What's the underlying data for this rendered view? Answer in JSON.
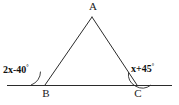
{
  "figure": {
    "type": "triangle-with-exterior-angles",
    "background_color": "#ffffff",
    "stroke_color": "#2b2b2b",
    "text_color": "#111111",
    "vertices": {
      "apex": {
        "name": "A",
        "label": "A",
        "x": 92,
        "y": 17
      },
      "left_base": {
        "name": "B",
        "label": "B",
        "x": 45,
        "y": 85
      },
      "right_base": {
        "name": "C",
        "label": "C",
        "x": 137,
        "y": 85
      }
    },
    "baseline": {
      "name": "base-line",
      "x1": 7,
      "y1": 85,
      "x2": 172,
      "y2": 85
    },
    "angles": {
      "left_exterior": {
        "expression": "2x-40",
        "degree_symbol": "°",
        "full_label": "2x-40°",
        "at_vertex": "B"
      },
      "right_exterior": {
        "expression": "x+45",
        "degree_symbol": "°",
        "full_label": "x+45°",
        "at_vertex": "C"
      }
    }
  }
}
